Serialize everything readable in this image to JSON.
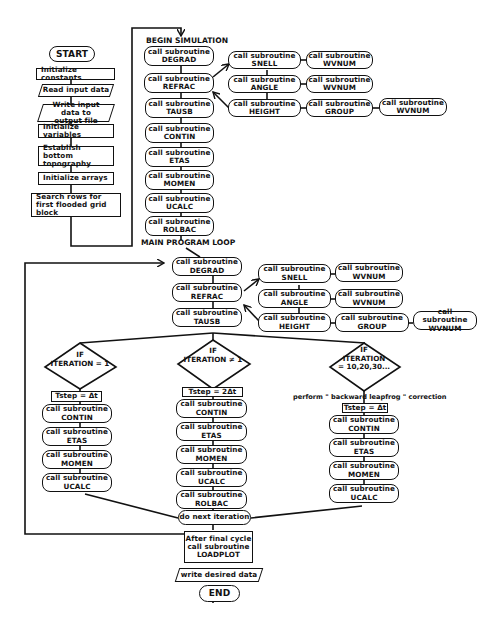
{
  "setup": {
    "start": "START",
    "steps": [
      "Initialize constants",
      "Read input data",
      "Write input data to output file",
      "Initialize variables",
      "Establish bottom topography",
      "Initialize arrays",
      "Search rows for first flooded grid block"
    ]
  },
  "begin_simulation": {
    "heading": "BEGIN SIMULATION",
    "call_prefix": "call subroutine",
    "subroutines": [
      "DEGRAD",
      "REFRAC",
      "TAUSB",
      "CONTIN",
      "ETAS",
      "MOMEN",
      "UCALC",
      "ROLBAC"
    ],
    "refrac_calls": {
      "snell": "SNELL",
      "angle": "ANGLE",
      "height": "HEIGHT",
      "snell_sub": "WVNUM",
      "angle_sub": "WVNUM",
      "group": "GROUP",
      "group_sub": "WVNUM"
    }
  },
  "main_loop": {
    "heading": "MAIN PROGRAM LOOP",
    "subroutines": [
      "DEGRAD",
      "REFRAC",
      "TAUSB"
    ],
    "refrac_calls": {
      "snell": "SNELL",
      "angle": "ANGLE",
      "height": "HEIGHT",
      "snell_sub": "WVNUM",
      "angle_sub": "WVNUM",
      "group": "GROUP",
      "group_sub": "WVNUM"
    },
    "branches": [
      {
        "if": "IF",
        "condition": "ITERATION = 1",
        "tstep": "Tstep = Δt",
        "subroutines": [
          "CONTIN",
          "ETAS",
          "MOMEN",
          "UCALC"
        ]
      },
      {
        "if": "IF",
        "condition": "ITERATION ≠ 1",
        "tstep": "Tstep = 2Δt",
        "subroutines": [
          "CONTIN",
          "ETAS",
          "MOMEN",
          "UCALC",
          "ROLBAC"
        ]
      },
      {
        "if": "IF",
        "condition_line1": "ITERATION",
        "condition_line2": "= 10,20,30...",
        "note": "perform \" backward leapfrog \" correction",
        "tstep": "Tstep = Δt",
        "subroutines": [
          "CONTIN",
          "ETAS",
          "MOMEN",
          "UCALC"
        ]
      }
    ],
    "next": "do next iteration"
  },
  "finish": {
    "final_line1": "After final cycle",
    "final_line2": "call subroutine",
    "final_line3": "LOADPLOT",
    "write": "write desired data",
    "end": "END"
  }
}
